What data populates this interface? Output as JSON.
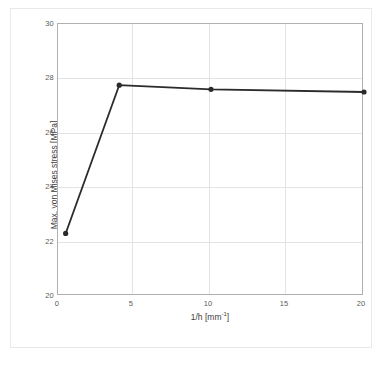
{
  "chart_data": {
    "type": "line",
    "title": "",
    "xlabel": "1/h [mm-1]",
    "xlabel_base": "1/h [mm",
    "xlabel_sup": "-1",
    "xlabel_close": "]",
    "ylabel": "Max. von Mises stress [MPa]",
    "xlim": [
      0,
      20
    ],
    "ylim": [
      20,
      30
    ],
    "xticks": [
      "0",
      "5",
      "10",
      "15",
      "20"
    ],
    "xtick_values": [
      0,
      5,
      10,
      15,
      20
    ],
    "yticks": [
      "20",
      "22",
      "24",
      "26",
      "28",
      "30"
    ],
    "ytick_values": [
      20,
      22,
      24,
      26,
      28,
      30
    ],
    "grid": true,
    "legend": "none",
    "series": [
      {
        "name": "Max. von Mises stress",
        "color": "#2b2b2b",
        "marker": "circle",
        "x": [
          0.5,
          4,
          10,
          20
        ],
        "values": [
          22.3,
          27.75,
          27.6,
          27.5
        ]
      }
    ]
  },
  "figure": {
    "background": "#ffffff",
    "frame_color": "#e9e9e9",
    "plot_border_color": "#b0b0b0",
    "grid_color": "#e3e3e3",
    "tick_label_color": "#5a5a5a",
    "axis_label_color": "#404040"
  }
}
